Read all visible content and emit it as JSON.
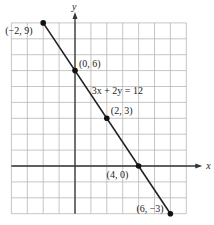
{
  "chart_data": {
    "type": "line",
    "title": "",
    "xlabel": "x",
    "ylabel": "y",
    "xlim": [
      -4,
      7
    ],
    "ylim": [
      -3,
      9
    ],
    "grid": true,
    "equation_label": "3x + 2y = 12",
    "series": [
      {
        "name": "3x + 2y = 12",
        "x": [
          -2,
          0,
          2,
          4,
          6
        ],
        "y": [
          9,
          6,
          3,
          0,
          -3
        ]
      }
    ],
    "points": [
      {
        "label": "(−2, 9)",
        "x": -2,
        "y": 9
      },
      {
        "label": "(0, 6)",
        "x": 0,
        "y": 6
      },
      {
        "label": "(2, 3)",
        "x": 2,
        "y": 3
      },
      {
        "label": "(4, 0)",
        "x": 4,
        "y": 0
      },
      {
        "label": "(6, −3)",
        "x": 6,
        "y": -3
      }
    ]
  },
  "colors": {
    "grid": "#b8b8b8",
    "axis": "#333333",
    "line": "#222222",
    "point": "#111111"
  }
}
